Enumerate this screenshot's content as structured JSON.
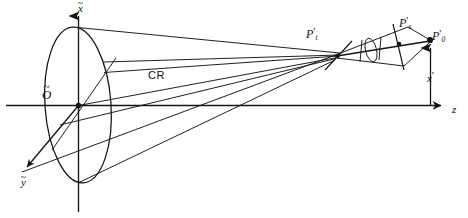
{
  "figure": {
    "kind": "optical-ray-diagram",
    "background_color": "#ffffff",
    "stroke_color": "#141414"
  },
  "axes": {
    "x_label": "x",
    "x_accent": "~",
    "y_label": "y",
    "y_accent": "~",
    "z_label": "z",
    "origin_label": "O",
    "origin_accent": "~"
  },
  "labels": {
    "chief_ray": "CR",
    "tangential_focus": "P",
    "tangential_focus_prime": "'",
    "tangential_focus_sub": "t",
    "sagittal_focus": "P",
    "sagittal_focus_prime": "'",
    "sagittal_focus_sub": "s",
    "image_point": "P",
    "image_point_prime": "'",
    "image_point_sub": "0",
    "image_height": "x",
    "image_height_prime": "'"
  },
  "geometry": {
    "pupil": {
      "cx": 78,
      "cy": 105,
      "rx": 33,
      "ry": 78,
      "rotation": -4
    },
    "origin_point": {
      "x": 78,
      "y": 105
    },
    "x_axis": {
      "x1": 78,
      "y1": 212,
      "x2": 78,
      "y2": 14
    },
    "y_axis": {
      "x1": 78,
      "y1": 105,
      "x2": 22,
      "y2": 172
    },
    "z_axis": {
      "x1": 6,
      "y1": 105,
      "x2": 447,
      "y2": 105
    },
    "tangential_focus_point": {
      "x": 337,
      "y": 55
    },
    "sagittal_focus_point": {
      "x": 400,
      "y": 44
    },
    "image_point_position": {
      "x": 430,
      "y": 40
    },
    "image_height_foot": {
      "x": 430,
      "y": 105
    },
    "pupil_rim_points": [
      {
        "x": 78,
        "y": 27
      },
      {
        "x": 104,
        "y": 62
      },
      {
        "x": 110,
        "y": 105
      },
      {
        "x": 100,
        "y": 150
      },
      {
        "x": 78,
        "y": 183
      },
      {
        "x": 52,
        "y": 150
      }
    ],
    "chief_ray": {
      "x1": 104,
      "y1": 72,
      "x2": 337,
      "y2": 55
    }
  }
}
